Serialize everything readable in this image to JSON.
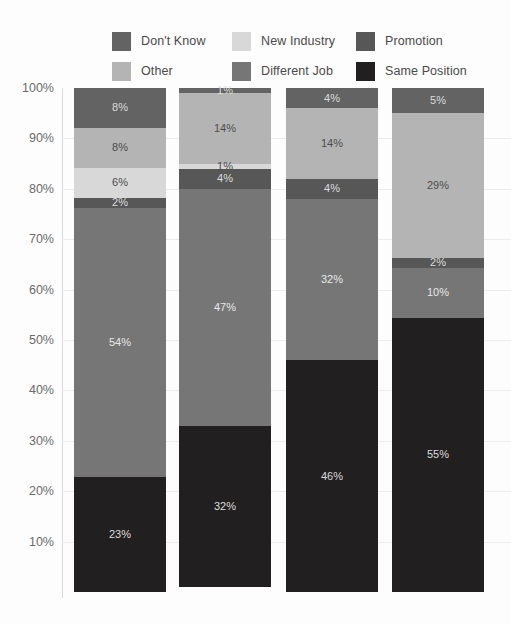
{
  "chart_data": {
    "type": "bar",
    "subtype": "stacked-percent",
    "title": "",
    "xlabel": "",
    "ylabel": "",
    "ylim": [
      0,
      100
    ],
    "grid": true,
    "legend_position": "top",
    "value_suffix": "%",
    "categories": [
      "Bar 1",
      "Bar 2",
      "Bar 3",
      "Bar 4"
    ],
    "y_ticks": [
      "100%",
      "90%",
      "80%",
      "70%",
      "60%",
      "50%",
      "40%",
      "30%",
      "20%",
      "10%"
    ],
    "y_tick_values": [
      100,
      90,
      80,
      70,
      60,
      50,
      40,
      30,
      20,
      10
    ],
    "stack_order_bottom_to_top": [
      "Same Position",
      "Different Job",
      "Promotion",
      "New Industry",
      "Other",
      "Don't Know"
    ],
    "series": [
      {
        "name": "Same Position",
        "color": "#221f20",
        "values": [
          23,
          32,
          46,
          55
        ],
        "labels": [
          "23%",
          "32%",
          "46%",
          "55%"
        ]
      },
      {
        "name": "Different Job",
        "color": "#767676",
        "values": [
          54,
          47,
          32,
          10
        ],
        "labels": [
          "54%",
          "47%",
          "32%",
          "10%"
        ]
      },
      {
        "name": "Promotion",
        "color": "#575757",
        "values": [
          2,
          4,
          4,
          2
        ],
        "labels": [
          "2%",
          "4%",
          "4%",
          "2%"
        ]
      },
      {
        "name": "New Industry",
        "color": "#d8d8d8",
        "values": [
          6,
          1,
          0,
          0
        ],
        "labels": [
          "6%",
          "1%",
          "",
          ""
        ]
      },
      {
        "name": "Other",
        "color": "#b4b4b4",
        "values": [
          8,
          14,
          14,
          29
        ],
        "labels": [
          "8%",
          "14%",
          "14%",
          "29%"
        ]
      },
      {
        "name": "Don't Know",
        "color": "#636363",
        "values": [
          8,
          1,
          4,
          5
        ],
        "labels": [
          "8%",
          "1%",
          "4%",
          "5%"
        ]
      }
    ]
  },
  "style": {
    "background": "#fdfdfd",
    "gridline_color": "#ececec",
    "axis_line_color": "#d8d8d8",
    "tick_text_color": "#6b6b6b",
    "legend_text_color": "#4a4a4a"
  }
}
